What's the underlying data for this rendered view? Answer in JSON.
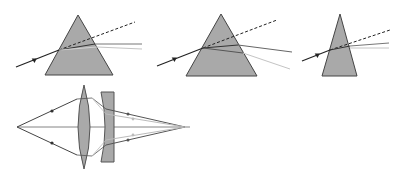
{
  "diagram": {
    "colors": {
      "glass_fill": "#a9a9a9",
      "glass_stroke": "#555555",
      "ray_dark": "#222222",
      "ray_mid": "#777777",
      "ray_light": "#c4c4c4",
      "background": "#ffffff"
    },
    "prisms": [
      {
        "name": "prism-1",
        "apex": [
          78,
          15
        ],
        "base_left": [
          45,
          75
        ],
        "base_right": [
          113,
          75
        ],
        "incident_from": [
          16,
          67
        ],
        "entry": [
          59,
          50
        ],
        "dashed_to": [
          135,
          22
        ],
        "exit_dark": [
          95,
          44
        ],
        "exit_light": [
          97,
          47
        ],
        "out_dark": [
          142,
          44
        ],
        "out_light": [
          142,
          49
        ]
      },
      {
        "name": "prism-2",
        "apex": [
          221,
          14
        ],
        "base_left": [
          186,
          76
        ],
        "base_right": [
          257,
          76
        ],
        "incident_from": [
          157,
          66
        ],
        "entry": [
          203,
          48
        ],
        "dashed_to": [
          277,
          20
        ],
        "exit_dark": [
          238,
          45
        ],
        "exit_light": [
          243,
          53
        ],
        "out_dark": [
          292,
          52
        ],
        "out_light": [
          290,
          69
        ]
      },
      {
        "name": "prism-3",
        "apex": [
          340,
          14
        ],
        "base_left": [
          322,
          76
        ],
        "base_right": [
          357,
          76
        ],
        "incident_from": [
          302,
          61
        ],
        "entry": [
          330,
          50
        ],
        "dashed_to": [
          390,
          30
        ],
        "exit_dark": [
          350,
          46
        ],
        "exit_light": [
          350,
          48
        ],
        "out_dark": [
          389,
          43
        ],
        "out_light": [
          389,
          48
        ]
      }
    ],
    "lens_system": {
      "axis_y": 127,
      "object_point": [
        17,
        127
      ],
      "focus_point": [
        185,
        127
      ],
      "convex_lens": {
        "cx": 84,
        "top": 85,
        "bottom": 169,
        "half_width": 12
      },
      "concave_lens": {
        "left": 101,
        "right": 114,
        "top": 92,
        "bottom": 162
      }
    }
  }
}
